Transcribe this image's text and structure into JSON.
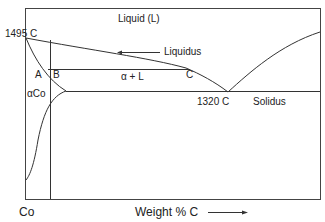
{
  "diagram": {
    "type": "phase-diagram",
    "regions": {
      "liquid": "Liquid (L)",
      "alpha_plus_liquid": "α + L",
      "alpha_co": "αCo"
    },
    "lines": {
      "liquidus": "Liquidus",
      "solidus": "Solidus"
    },
    "temperatures": {
      "melting_point": "1495 C",
      "eutectic": "1320 C"
    },
    "points": {
      "a": "A",
      "b": "B",
      "c": "C"
    },
    "axes": {
      "origin_label": "Co",
      "x_label": "Weight % C",
      "x_arrow": "→"
    }
  }
}
